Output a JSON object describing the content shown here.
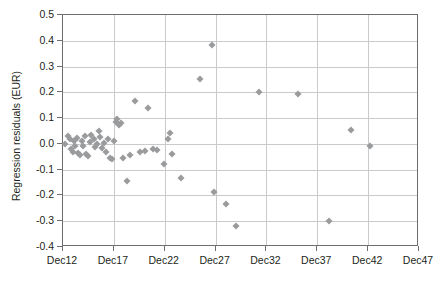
{
  "chart_data": {
    "type": "scatter",
    "title": "",
    "xlabel": "",
    "ylabel": "Regression residuals (EUR)",
    "grid": true,
    "legend": "none",
    "marker": {
      "shape": "diamond",
      "color": "#9a9b9d",
      "size": 5
    },
    "xlim": [
      12,
      47
    ],
    "ylim": [
      -0.4,
      0.5
    ],
    "x_ticks": [
      12,
      17,
      22,
      27,
      32,
      37,
      42,
      47
    ],
    "x_tick_labels": [
      "Dec12",
      "Dec17",
      "Dec22",
      "Dec27",
      "Dec32",
      "Dec37",
      "Dec42",
      "Dec47"
    ],
    "y_ticks": [
      -0.4,
      -0.3,
      -0.2,
      -0.1,
      0.0,
      0.1,
      0.2,
      0.3,
      0.4,
      0.5
    ],
    "y_tick_labels": [
      "-0.4",
      "-0.3",
      "-0.2",
      "-0.1",
      "0.0",
      "0.1",
      "0.2",
      "0.3",
      "0.4",
      "0.5"
    ],
    "points": [
      {
        "x": 12.2,
        "y": 0.0
      },
      {
        "x": 12.5,
        "y": 0.03
      },
      {
        "x": 12.7,
        "y": 0.018
      },
      {
        "x": 12.8,
        "y": -0.02
      },
      {
        "x": 13.0,
        "y": -0.03
      },
      {
        "x": 13.1,
        "y": 0.01
      },
      {
        "x": 13.2,
        "y": -0.01
      },
      {
        "x": 13.4,
        "y": 0.022
      },
      {
        "x": 13.5,
        "y": -0.035
      },
      {
        "x": 13.7,
        "y": -0.045
      },
      {
        "x": 13.9,
        "y": 0.012
      },
      {
        "x": 14.0,
        "y": -0.008
      },
      {
        "x": 14.2,
        "y": 0.03
      },
      {
        "x": 14.3,
        "y": -0.04
      },
      {
        "x": 14.5,
        "y": -0.048
      },
      {
        "x": 14.7,
        "y": 0.008
      },
      {
        "x": 14.8,
        "y": 0.035
      },
      {
        "x": 15.0,
        "y": 0.02
      },
      {
        "x": 15.1,
        "y": -0.012
      },
      {
        "x": 15.3,
        "y": 0.0
      },
      {
        "x": 15.5,
        "y": 0.05
      },
      {
        "x": 15.6,
        "y": 0.028
      },
      {
        "x": 15.8,
        "y": -0.015
      },
      {
        "x": 16.0,
        "y": 0.005
      },
      {
        "x": 16.2,
        "y": -0.03
      },
      {
        "x": 16.4,
        "y": 0.018
      },
      {
        "x": 16.6,
        "y": -0.055
      },
      {
        "x": 16.8,
        "y": -0.058
      },
      {
        "x": 17.0,
        "y": 0.012
      },
      {
        "x": 17.2,
        "y": 0.085
      },
      {
        "x": 17.3,
        "y": 0.095
      },
      {
        "x": 17.5,
        "y": 0.075
      },
      {
        "x": 17.7,
        "y": 0.08
      },
      {
        "x": 17.9,
        "y": -0.055
      },
      {
        "x": 18.3,
        "y": -0.145
      },
      {
        "x": 18.6,
        "y": -0.042
      },
      {
        "x": 19.1,
        "y": 0.165
      },
      {
        "x": 19.6,
        "y": -0.03
      },
      {
        "x": 20.1,
        "y": -0.028
      },
      {
        "x": 20.4,
        "y": 0.14
      },
      {
        "x": 20.8,
        "y": -0.018
      },
      {
        "x": 21.2,
        "y": -0.022
      },
      {
        "x": 21.9,
        "y": -0.078
      },
      {
        "x": 22.3,
        "y": 0.018
      },
      {
        "x": 22.5,
        "y": 0.042
      },
      {
        "x": 22.7,
        "y": -0.038
      },
      {
        "x": 23.6,
        "y": -0.133
      },
      {
        "x": 25.5,
        "y": 0.25
      },
      {
        "x": 26.6,
        "y": 0.385
      },
      {
        "x": 26.8,
        "y": -0.185
      },
      {
        "x": 28.0,
        "y": -0.235
      },
      {
        "x": 29.0,
        "y": -0.32
      },
      {
        "x": 31.3,
        "y": 0.2
      },
      {
        "x": 35.1,
        "y": 0.195
      },
      {
        "x": 38.2,
        "y": -0.3
      },
      {
        "x": 40.3,
        "y": 0.055
      },
      {
        "x": 42.2,
        "y": -0.01
      }
    ]
  }
}
